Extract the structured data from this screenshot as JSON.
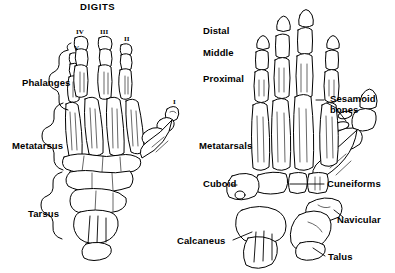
{
  "figure": {
    "title": "DIGITS",
    "background_color": "#ffffff",
    "ink_color": "#000000"
  },
  "left_panel": {
    "name": "dorsal view of foot skeleton with regional labels",
    "title": "DIGITS",
    "digit_numerals": [
      {
        "numeral": "V",
        "x": 74,
        "y": 46
      },
      {
        "numeral": "IV",
        "x": 78,
        "y": 30
      },
      {
        "numeral": "III",
        "x": 103,
        "y": 30
      },
      {
        "numeral": "II",
        "x": 125,
        "y": 37
      },
      {
        "numeral": "I",
        "x": 174,
        "y": 100
      }
    ],
    "region_labels": [
      {
        "text": "Phalanges",
        "x": 22,
        "y": 83
      },
      {
        "text": "Metatarsus",
        "x": 12,
        "y": 146
      },
      {
        "text": "Tarsus",
        "x": 28,
        "y": 214
      }
    ]
  },
  "right_panel": {
    "name": "detailed view of foot bones with individual bone names",
    "phalanx_row_labels": [
      {
        "text": "Distal",
        "x": 203,
        "y": 30
      },
      {
        "text": "Middle",
        "x": 203,
        "y": 52
      },
      {
        "text": "Proximal",
        "x": 203,
        "y": 78
      }
    ],
    "bone_labels": [
      {
        "text": "Sesamoid",
        "x": 330,
        "y": 99
      },
      {
        "text": "bones",
        "x": 330,
        "y": 110
      },
      {
        "text": "Metatarsals",
        "x": 199,
        "y": 146
      },
      {
        "text": "Cuboid",
        "x": 203,
        "y": 184
      },
      {
        "text": "Cuneiforms",
        "x": 327,
        "y": 184
      },
      {
        "text": "Navicular",
        "x": 337,
        "y": 220
      },
      {
        "text": "Calcaneus",
        "x": 180,
        "y": 242
      },
      {
        "text": "Talus",
        "x": 328,
        "y": 257
      }
    ]
  },
  "all_terms": [
    "DIGITS",
    "I",
    "II",
    "III",
    "IV",
    "V",
    "Phalanges",
    "Metatarsus",
    "Tarsus",
    "Distal",
    "Middle",
    "Proximal",
    "Sesamoid bones",
    "Metatarsals",
    "Cuboid",
    "Cuneiforms",
    "Navicular",
    "Calcaneus",
    "Talus"
  ]
}
